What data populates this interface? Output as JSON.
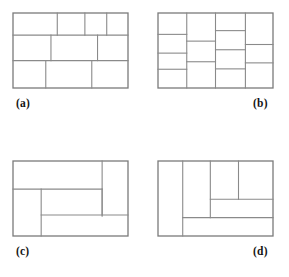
{
  "figure": {
    "canvas": {
      "width": 289,
      "height": 277,
      "background": "#ffffff"
    },
    "line_color": "#8a8a8a",
    "frame_color": "#7a7a7a",
    "line_width": 1.1,
    "frame_width": 1.3,
    "label_color": "#141414"
  },
  "panels": [
    {
      "id": "panel-a",
      "label": "(a)",
      "label_align": "left",
      "box": {
        "x": 13,
        "y": 13,
        "width": 115,
        "height": 75
      },
      "label_pos": {
        "x": 16,
        "y": 98
      },
      "description": "three horizontal bands subdivided into 4, 3 and 3 cells",
      "segments": [
        {
          "name": "band-1-bottom",
          "x1": 0.0,
          "y1": 0.295,
          "x2": 1.0,
          "y2": 0.295
        },
        {
          "name": "band-2-bottom",
          "x1": 0.0,
          "y1": 0.635,
          "x2": 1.0,
          "y2": 0.635
        },
        {
          "name": "row1-div-1",
          "x1": 0.385,
          "y1": 0.0,
          "x2": 0.385,
          "y2": 0.295
        },
        {
          "name": "row1-div-2",
          "x1": 0.625,
          "y1": 0.0,
          "x2": 0.625,
          "y2": 0.295
        },
        {
          "name": "row1-div-3",
          "x1": 0.815,
          "y1": 0.0,
          "x2": 0.815,
          "y2": 0.295
        },
        {
          "name": "row2-div-1",
          "x1": 0.33,
          "y1": 0.295,
          "x2": 0.33,
          "y2": 0.635
        },
        {
          "name": "row2-div-2",
          "x1": 0.735,
          "y1": 0.295,
          "x2": 0.735,
          "y2": 0.635
        },
        {
          "name": "row3-div-1",
          "x1": 0.285,
          "y1": 0.635,
          "x2": 0.285,
          "y2": 1.0
        },
        {
          "name": "row3-div-2",
          "x1": 0.685,
          "y1": 0.635,
          "x2": 0.685,
          "y2": 1.0
        }
      ]
    },
    {
      "id": "panel-b",
      "label": "(b)",
      "label_align": "right",
      "box": {
        "x": 158,
        "y": 13,
        "width": 115,
        "height": 75
      },
      "label_pos": {
        "x": 253,
        "y": 98
      },
      "description": "four vertical columns each subdivided into 3 or 4 stacked cells",
      "segments": [
        {
          "name": "col-div-1",
          "x1": 0.25,
          "y1": 0.0,
          "x2": 0.25,
          "y2": 1.0
        },
        {
          "name": "col-div-2",
          "x1": 0.5,
          "y1": 0.0,
          "x2": 0.5,
          "y2": 1.0
        },
        {
          "name": "col-div-3",
          "x1": 0.76,
          "y1": 0.0,
          "x2": 0.76,
          "y2": 1.0
        },
        {
          "name": "col1-row-1",
          "x1": 0.0,
          "y1": 0.285,
          "x2": 0.25,
          "y2": 0.285
        },
        {
          "name": "col1-row-2",
          "x1": 0.0,
          "y1": 0.535,
          "x2": 0.25,
          "y2": 0.535
        },
        {
          "name": "col1-row-3",
          "x1": 0.0,
          "y1": 0.75,
          "x2": 0.25,
          "y2": 0.75
        },
        {
          "name": "col2-row-1",
          "x1": 0.25,
          "y1": 0.375,
          "x2": 0.5,
          "y2": 0.375
        },
        {
          "name": "col2-row-2",
          "x1": 0.25,
          "y1": 0.65,
          "x2": 0.5,
          "y2": 0.65
        },
        {
          "name": "col3-row-1",
          "x1": 0.5,
          "y1": 0.235,
          "x2": 0.76,
          "y2": 0.235
        },
        {
          "name": "col3-row-2",
          "x1": 0.5,
          "y1": 0.49,
          "x2": 0.76,
          "y2": 0.49
        },
        {
          "name": "col3-row-3",
          "x1": 0.5,
          "y1": 0.745,
          "x2": 0.76,
          "y2": 0.745
        },
        {
          "name": "col4-row-1",
          "x1": 0.76,
          "y1": 0.42,
          "x2": 1.0,
          "y2": 0.42
        },
        {
          "name": "col4-row-2",
          "x1": 0.76,
          "y1": 0.665,
          "x2": 1.0,
          "y2": 0.665
        }
      ]
    },
    {
      "id": "panel-c",
      "label": "(c)",
      "label_align": "left",
      "box": {
        "x": 13,
        "y": 161,
        "width": 115,
        "height": 75
      },
      "label_pos": {
        "x": 16,
        "y": 246
      },
      "description": "pinwheel style partition with five rectangles",
      "segments": [
        {
          "name": "right-col-div",
          "x1": 0.775,
          "y1": 0.0,
          "x2": 0.775,
          "y2": 0.735
        },
        {
          "name": "top-band-bottom",
          "x1": 0.0,
          "y1": 0.375,
          "x2": 0.775,
          "y2": 0.375
        },
        {
          "name": "left-col-div",
          "x1": 0.245,
          "y1": 0.375,
          "x2": 0.245,
          "y2": 1.0
        },
        {
          "name": "mid-band-bottom",
          "x1": 0.245,
          "y1": 0.72,
          "x2": 1.0,
          "y2": 0.72
        },
        {
          "name": "right-col-end",
          "x1": 0.775,
          "y1": 0.375,
          "x2": 0.775,
          "y2": 0.72
        }
      ]
    },
    {
      "id": "panel-d",
      "label": "(d)",
      "label_align": "right",
      "box": {
        "x": 158,
        "y": 161,
        "width": 115,
        "height": 75
      },
      "label_pos": {
        "x": 253,
        "y": 246
      },
      "description": "tall left column plus nested subdivisions at upper right",
      "segments": [
        {
          "name": "outer-left-div",
          "x1": 0.215,
          "y1": 0.0,
          "x2": 0.215,
          "y2": 1.0
        },
        {
          "name": "bottom-band-top",
          "x1": 0.215,
          "y1": 0.755,
          "x2": 1.0,
          "y2": 0.755
        },
        {
          "name": "inner-col-div",
          "x1": 0.455,
          "y1": 0.0,
          "x2": 0.455,
          "y2": 0.755
        },
        {
          "name": "upper-right-row",
          "x1": 0.455,
          "y1": 0.51,
          "x2": 1.0,
          "y2": 0.51
        },
        {
          "name": "upper-cell-div",
          "x1": 0.7,
          "y1": 0.0,
          "x2": 0.7,
          "y2": 0.51
        }
      ]
    }
  ]
}
